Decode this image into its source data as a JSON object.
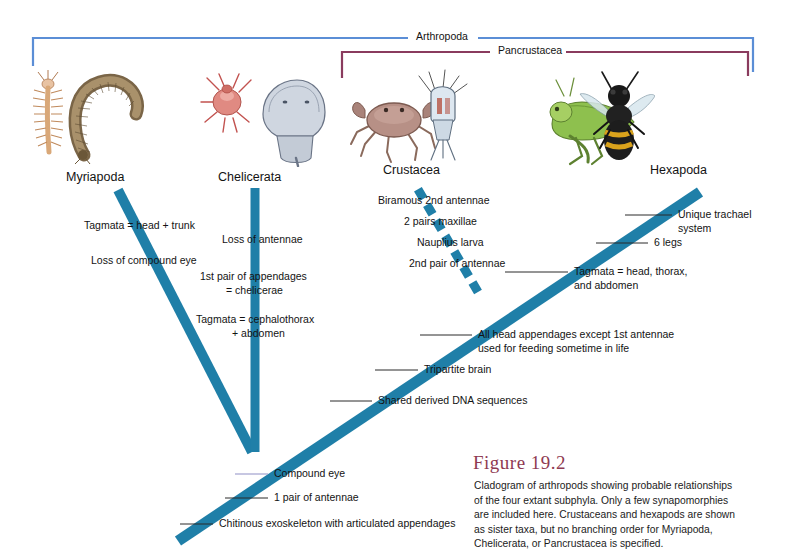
{
  "figure": {
    "title": "Figure 19.2",
    "caption": "Cladogram of arthropods showing probable relationships of the four extant subphyla. Only a few synapomorphies are included here. Crustaceans and hexapods are shown as sister taxa, but no branching order for Myriapoda, Chelicerata, or Pancrustacea is specified.",
    "title_color": "#8f3a52"
  },
  "colors": {
    "branch": "#1f7fa8",
    "arthropoda_bracket": "#5b8ed6",
    "pancrustacea_bracket": "#8a3b5e",
    "leader_line": "#2b2b2b",
    "compound_eye_leader": "#8f8fc6"
  },
  "clades": [
    {
      "name": "Arthropoda",
      "label": "Arthropoda",
      "bracket_color": "#5b8ed6"
    },
    {
      "name": "Pancrustacea",
      "label": "Pancrustacea",
      "bracket_color": "#8a3b5e"
    }
  ],
  "taxa": [
    {
      "name": "myriapoda",
      "label": "Myriapoda",
      "organism": "millipede-centipede-illustration"
    },
    {
      "name": "chelicerata",
      "label": "Chelicerata",
      "organism": "tick-horseshoe-crab-illustration"
    },
    {
      "name": "crustacea",
      "label": "Crustacea",
      "organism": "crab-copepod-illustration"
    },
    {
      "name": "hexapoda",
      "label": "Hexapoda",
      "organism": "grasshopper-bee-illustration"
    }
  ],
  "synapomorphies": [
    {
      "id": "tagmata-head-trunk",
      "text": "Tagmata = head + trunk",
      "branch": "myriapoda"
    },
    {
      "id": "loss-compound-eye",
      "text": "Loss of compound eye",
      "branch": "myriapoda"
    },
    {
      "id": "loss-antennae",
      "text": "Loss of antennae",
      "branch": "chelicerata"
    },
    {
      "id": "first-pair-appendages",
      "text": "1st pair of appendages",
      "branch": "chelicerata"
    },
    {
      "id": "chelicerae",
      "text": "= chelicerae",
      "branch": "chelicerata"
    },
    {
      "id": "tagmata-cephalothorax",
      "text": "Tagmata = cephalothorax",
      "branch": "chelicerata"
    },
    {
      "id": "plus-abdomen",
      "text": "+ abdomen",
      "branch": "chelicerata"
    },
    {
      "id": "biramous-2nd-antennae",
      "text": "Biramous 2nd antennae",
      "branch": "crustacea"
    },
    {
      "id": "two-pairs-maxillae",
      "text": "2 pairs maxillae",
      "branch": "crustacea"
    },
    {
      "id": "nauplius-larva",
      "text": "Nauplius larva",
      "branch": "crustacea"
    },
    {
      "id": "second-pair-antennae",
      "text": "2nd pair of antennae",
      "branch": "crustacea"
    },
    {
      "id": "unique-tracheal-1",
      "text": "Unique trachael",
      "branch": "hexapoda"
    },
    {
      "id": "unique-tracheal-2",
      "text": "system",
      "branch": "hexapoda"
    },
    {
      "id": "six-legs",
      "text": "6 legs",
      "branch": "hexapoda"
    },
    {
      "id": "tagmata-head-thorax",
      "text": "Tagmata = head, thorax,",
      "branch": "hexapoda"
    },
    {
      "id": "and-abdomen",
      "text": "and abdomen",
      "branch": "hexapoda"
    },
    {
      "id": "head-appendages-1",
      "text": "All head appendages except 1st antennae",
      "branch": "pancrustacea"
    },
    {
      "id": "head-appendages-2",
      "text": "used for feeding sometime in life",
      "branch": "pancrustacea"
    },
    {
      "id": "tripartite-brain",
      "text": "Tripartite brain",
      "branch": "trunk"
    },
    {
      "id": "shared-dna",
      "text": "Shared derived DNA sequences",
      "branch": "trunk"
    },
    {
      "id": "compound-eye",
      "text": "Compound eye",
      "branch": "trunk"
    },
    {
      "id": "one-pair-antennae",
      "text": "1 pair of antennae",
      "branch": "trunk"
    },
    {
      "id": "chitinous-exoskeleton",
      "text": "Chitinous exoskeleton with articulated appendages",
      "branch": "trunk"
    }
  ]
}
